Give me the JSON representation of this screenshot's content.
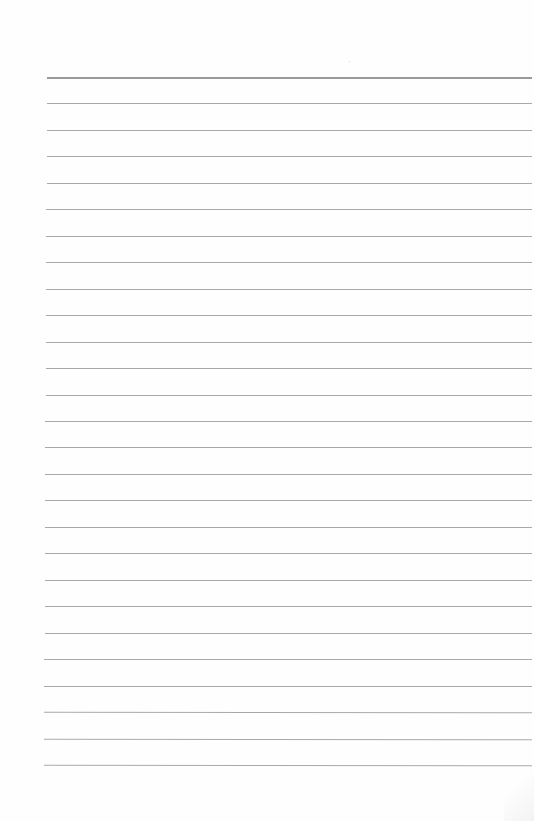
{
  "document": {
    "type": "lined-paper",
    "background_color": "#ffffff",
    "rule_color": "#a9a9a9",
    "rule_count": 27,
    "first_rule_y": 77,
    "rule_spacing_px": 26.46,
    "rule_left_x": 47,
    "text_lines": []
  }
}
